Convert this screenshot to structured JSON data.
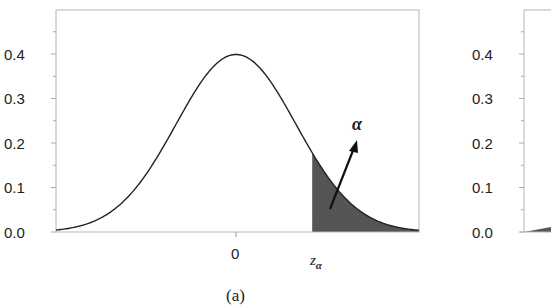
{
  "chart_data": [
    {
      "panel": "(a)",
      "type": "area",
      "title": "",
      "xlabel": "",
      "ylabel": "",
      "description": "Standard normal density with shaded upper tail beyond z_alpha",
      "ylim": [
        0.0,
        0.47
      ],
      "xlim": [
        -3.0,
        3.05
      ],
      "yticks": [
        0.0,
        0.1,
        0.2,
        0.3,
        0.4
      ],
      "ytick_labels": [
        "0.0",
        "0.1",
        "0.2",
        "0.3",
        "0.4"
      ],
      "xticks": [
        0,
        1.27
      ],
      "xtick_labels": [
        "0",
        "z_α"
      ],
      "grid": false,
      "series": [
        {
          "name": "density",
          "distribution": "normal",
          "mean": 0,
          "sd": 1,
          "x": [
            -3.0,
            -2.5,
            -2.0,
            -1.5,
            -1.0,
            -0.5,
            0.0,
            0.5,
            1.0,
            1.27,
            1.5,
            2.0,
            2.5,
            3.0
          ],
          "values": [
            0.004,
            0.018,
            0.054,
            0.13,
            0.242,
            0.352,
            0.399,
            0.352,
            0.242,
            0.178,
            0.13,
            0.054,
            0.018,
            0.004
          ]
        }
      ],
      "shaded_region": {
        "from": 1.27,
        "to": 3.05,
        "side": "upper",
        "color": "#555555"
      },
      "annotations": [
        {
          "text": "α",
          "role": "tail-probability-label",
          "arrow": true
        }
      ],
      "caption": "(a)"
    },
    {
      "panel": "(b)",
      "type": "area",
      "partial": true,
      "ylim": [
        0.0,
        0.47
      ],
      "yticks": [
        0.0,
        0.1,
        0.2,
        0.3,
        0.4
      ],
      "ytick_labels": [
        "0.0",
        "0.1",
        "0.2",
        "0.3",
        "0.4"
      ],
      "shaded_region": {
        "side": "lower",
        "color": "#555555"
      }
    }
  ],
  "panelA": {
    "yticks": [
      "0.0",
      "0.1",
      "0.2",
      "0.3",
      "0.4"
    ],
    "xtick_zero": "0",
    "z_symbol": "z",
    "z_subscript": "α",
    "alpha_label": "α",
    "caption": "(a)"
  },
  "panelB": {
    "yticks": [
      "0.0",
      "0.1",
      "0.2",
      "0.3",
      "0.4"
    ]
  },
  "colors": {
    "curve": "#222222",
    "shade": "#555555",
    "frame": "#b0b0b0"
  }
}
